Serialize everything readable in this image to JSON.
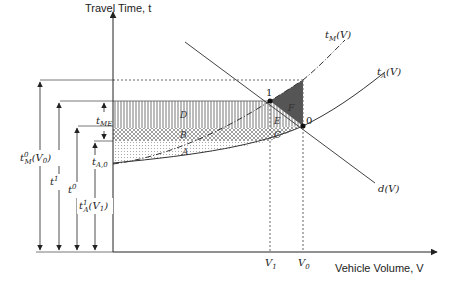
{
  "axes": {
    "y_label": "Travel Time, t",
    "x_label": "Vehicle Volume, V"
  },
  "curves": {
    "marginal_cost": {
      "name": "t",
      "sub": "M",
      "arg": "(V)"
    },
    "average_cost": {
      "name": "t",
      "sub": "A",
      "arg": "(V)"
    },
    "demand": {
      "name": "d(V)"
    }
  },
  "points": {
    "equilibrium_optimal": "1",
    "equilibrium_unpriced": "0"
  },
  "x_ticks": {
    "v1": {
      "base": "V",
      "sub": "1"
    },
    "v0": {
      "base": "V",
      "sub": "0"
    }
  },
  "regions": {
    "a": "A",
    "b": "B",
    "c": "C",
    "d": "D",
    "e": "E",
    "f": "F"
  },
  "dimension_labels": {
    "tm0": {
      "base": "t",
      "sup": "0",
      "sub": "M",
      "arg": "(V",
      "argsub": "0",
      "close": ")"
    },
    "t1": {
      "base": "t",
      "sup": "1"
    },
    "t0": {
      "base": "t",
      "sup": "0"
    },
    "ta1": {
      "base": "t",
      "sup": "1",
      "sub": "A",
      "arg": "(V",
      "argsub": "1",
      "close": ")"
    },
    "tme": {
      "base": "t",
      "sub": "ME"
    },
    "ta0": {
      "base": "t",
      "sub": "A,0"
    }
  }
}
